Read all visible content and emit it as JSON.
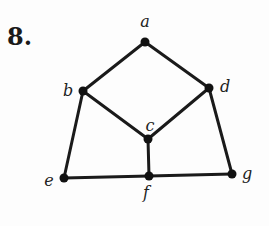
{
  "problem_number": "8.",
  "graph": {
    "nodes": [
      {
        "id": "a",
        "label": "a",
        "x": 145,
        "y": 42,
        "lx": 145,
        "ly": 27,
        "anchor": "middle"
      },
      {
        "id": "b",
        "label": "b",
        "x": 83,
        "y": 91,
        "lx": 68,
        "ly": 96,
        "anchor": "middle"
      },
      {
        "id": "c",
        "label": "c",
        "x": 148,
        "y": 139,
        "lx": 150,
        "ly": 131,
        "anchor": "middle"
      },
      {
        "id": "d",
        "label": "d",
        "x": 209,
        "y": 88,
        "lx": 225,
        "ly": 92,
        "anchor": "middle"
      },
      {
        "id": "e",
        "label": "e",
        "x": 64,
        "y": 178,
        "lx": 49,
        "ly": 186,
        "anchor": "middle"
      },
      {
        "id": "f",
        "label": "f",
        "x": 149,
        "y": 176,
        "lx": 146,
        "ly": 198,
        "anchor": "middle"
      },
      {
        "id": "g",
        "label": "g",
        "x": 232,
        "y": 174,
        "lx": 247,
        "ly": 179,
        "anchor": "middle"
      }
    ],
    "edges": [
      [
        "a",
        "b"
      ],
      [
        "a",
        "d"
      ],
      [
        "b",
        "c"
      ],
      [
        "d",
        "c"
      ],
      [
        "b",
        "e"
      ],
      [
        "d",
        "g"
      ],
      [
        "c",
        "f"
      ],
      [
        "e",
        "f"
      ],
      [
        "f",
        "g"
      ]
    ],
    "stroke_color": "#1a1a1a",
    "node_color": "#111111"
  }
}
